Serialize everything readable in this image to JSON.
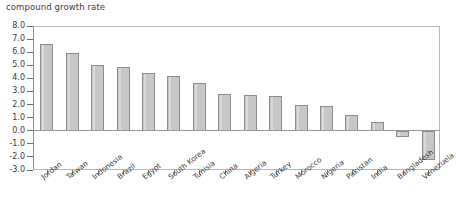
{
  "axis_title": "compound growth rate",
  "colors": {
    "bar_fill": "#c7c7c7",
    "bar_border": "#8d8d8d",
    "axis": "#8d8d8d",
    "text": "#3d3d3d",
    "background": "#ffffff"
  },
  "chart_data": {
    "type": "bar",
    "title": "",
    "subtitle": "",
    "xlabel": "",
    "ylabel": "compound growth rate",
    "ylim": [
      -3.0,
      8.0
    ],
    "ytick_values": [
      8.0,
      7.0,
      6.0,
      5.0,
      4.0,
      3.0,
      2.0,
      1.0,
      0.0,
      -1.0,
      -2.0,
      -3.0
    ],
    "ytick_labels": [
      "8.0",
      "7.0",
      "6.0",
      "5.0",
      "4.0",
      "3.0",
      "2.0",
      "1.0",
      "0.0",
      "-1.0",
      "-2.0",
      "-3.0"
    ],
    "grid": false,
    "legend": false,
    "legend_position": "none",
    "categories": [
      "Jordan",
      "Taiwan",
      "Indonesia",
      "Brazil",
      "Egypt",
      "South Korea",
      "Tunisia",
      "China",
      "Algeria",
      "Turkey",
      "Morocco",
      "Nigeria",
      "Pakistan",
      "India",
      "Bangladesh",
      "Venezuela"
    ],
    "values": [
      6.6,
      5.95,
      5.0,
      4.9,
      4.4,
      4.2,
      3.65,
      2.8,
      2.7,
      2.65,
      1.95,
      1.9,
      1.2,
      0.7,
      -0.5,
      -2.2
    ]
  }
}
